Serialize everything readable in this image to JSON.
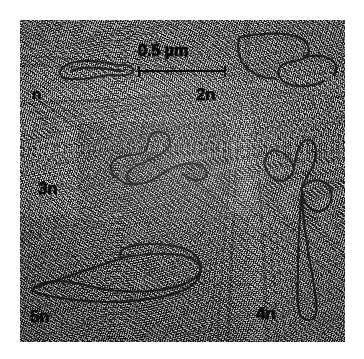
{
  "figure": {
    "kind": "electron-micrograph-montage",
    "background_color": "#ffffff",
    "plate_color": "#8a8a8a",
    "ink_color": "#121212"
  },
  "scalebar": {
    "text": "0.5 µm",
    "length_label": "0.5",
    "unit": "µm"
  },
  "labels": [
    {
      "id": "n",
      "text": "n",
      "x": 32,
      "y": 86,
      "size": 15
    },
    {
      "id": "2n",
      "text": "2n",
      "x": 196,
      "y": 86,
      "size": 17
    },
    {
      "id": "3n",
      "text": "3n",
      "x": 38,
      "y": 180,
      "size": 17
    },
    {
      "id": "5n",
      "text": "5n",
      "x": 30,
      "y": 308,
      "size": 17
    },
    {
      "id": "4n",
      "text": "4n",
      "x": 256,
      "y": 305,
      "size": 17
    }
  ],
  "panels": [
    {
      "id": "panel-top",
      "x": 20,
      "y": 20,
      "w": 325,
      "h": 100,
      "tone": "#9a9a9a"
    },
    {
      "id": "panel-middle-left",
      "x": 20,
      "y": 120,
      "w": 230,
      "h": 95,
      "tone": "#a6a6a6"
    },
    {
      "id": "panel-middle-inner",
      "x": 78,
      "y": 122,
      "w": 152,
      "h": 92,
      "tone": "#b2b2b2"
    },
    {
      "id": "panel-bottom-left",
      "x": 20,
      "y": 215,
      "w": 230,
      "h": 127,
      "tone": "#6e6e6e"
    },
    {
      "id": "panel-right-column",
      "x": 250,
      "y": 120,
      "w": 95,
      "h": 222,
      "tone": "#8f8f8f"
    }
  ],
  "molecules": [
    {
      "id": "molecule-n",
      "label": "n",
      "x": 50,
      "y": 52,
      "w": 90,
      "h": 34,
      "viewbox": "0 0 90 34",
      "path": "M10 20 C 12 12, 26 8, 42 9 C 56 10, 64 13, 72 13 C 80 13, 84 16, 83 19 C 82 23, 74 24, 66 23 C 56 22, 46 26, 34 27 C 20 28, 8 26, 10 20 Z M22 19 C 30 15, 44 15, 56 17 C 64 18, 70 19, 74 19"
    },
    {
      "id": "molecule-2n",
      "label": "2n",
      "x": 232,
      "y": 25,
      "w": 112,
      "h": 78,
      "viewbox": "0 0 112 78",
      "path": "M8 12 C 30 8, 52 7, 66 12 C 78 17, 80 28, 72 33 C 66 37, 56 36, 50 40 C 44 45, 46 54, 54 58 C 64 63, 80 62, 92 56 M8 12 C 4 22, 6 34, 14 42 C 22 50, 34 54, 44 54 M72 33 C 80 30, 90 30, 98 34 C 104 37, 106 44, 102 50"
    },
    {
      "id": "molecule-3n",
      "label": "3n",
      "x": 96,
      "y": 126,
      "w": 126,
      "h": 66,
      "viewbox": "0 0 126 66",
      "path": "M22 52 C 14 48, 12 38, 20 33 C 28 28, 42 30, 48 26 C 54 22, 50 12, 56 8 C 63 3, 74 7, 74 16 C 74 24, 64 28, 58 32 C 50 37, 40 38, 34 44 C 28 50, 32 58, 42 58 C 54 58, 62 50, 70 45 C 80 39, 92 36, 100 38 C 110 40, 114 48, 108 52 C 102 56, 92 53, 86 48 M22 52 C 26 58, 36 60, 44 57"
    },
    {
      "id": "molecule-5n",
      "label": "5n",
      "x": 26,
      "y": 236,
      "w": 208,
      "h": 80,
      "viewbox": "0 0 208 80",
      "path": "M8 52 C 18 44, 36 44, 50 47 C 64 50, 76 54, 92 55 C 120 57, 150 54, 166 44 C 180 35, 176 24, 158 20 C 140 16, 112 18, 96 22 M96 22 C 88 14, 104 8, 124 8 C 146 8, 164 12, 170 20 C 178 30, 176 44, 162 52 C 146 61, 112 66, 82 66 C 56 66, 30 62, 16 58 C 6 55, 4 55, 8 52 Z"
    },
    {
      "id": "molecule-4n",
      "label": "4n",
      "x": 258,
      "y": 128,
      "w": 86,
      "h": 200,
      "viewbox": "0 0 86 200",
      "path": "M36 40 C 30 24, 16 18, 10 26 C 4 34, 8 48, 18 52 C 26 55, 34 50, 36 40 Z M36 40 C 38 22, 44 10, 52 12 C 60 14, 60 28, 54 40 C 50 48, 46 52, 44 60 M44 60 C 48 54, 58 50, 66 54 C 74 58, 76 70, 70 78 C 64 86, 54 84, 48 76 C 44 70, 44 64, 44 60 Z M44 60 C 42 86, 40 110, 40 134 C 40 158, 38 176, 42 186 C 46 194, 56 194, 58 186 C 60 176, 56 158, 52 134 C 48 110, 44 86, 44 60"
    }
  ]
}
